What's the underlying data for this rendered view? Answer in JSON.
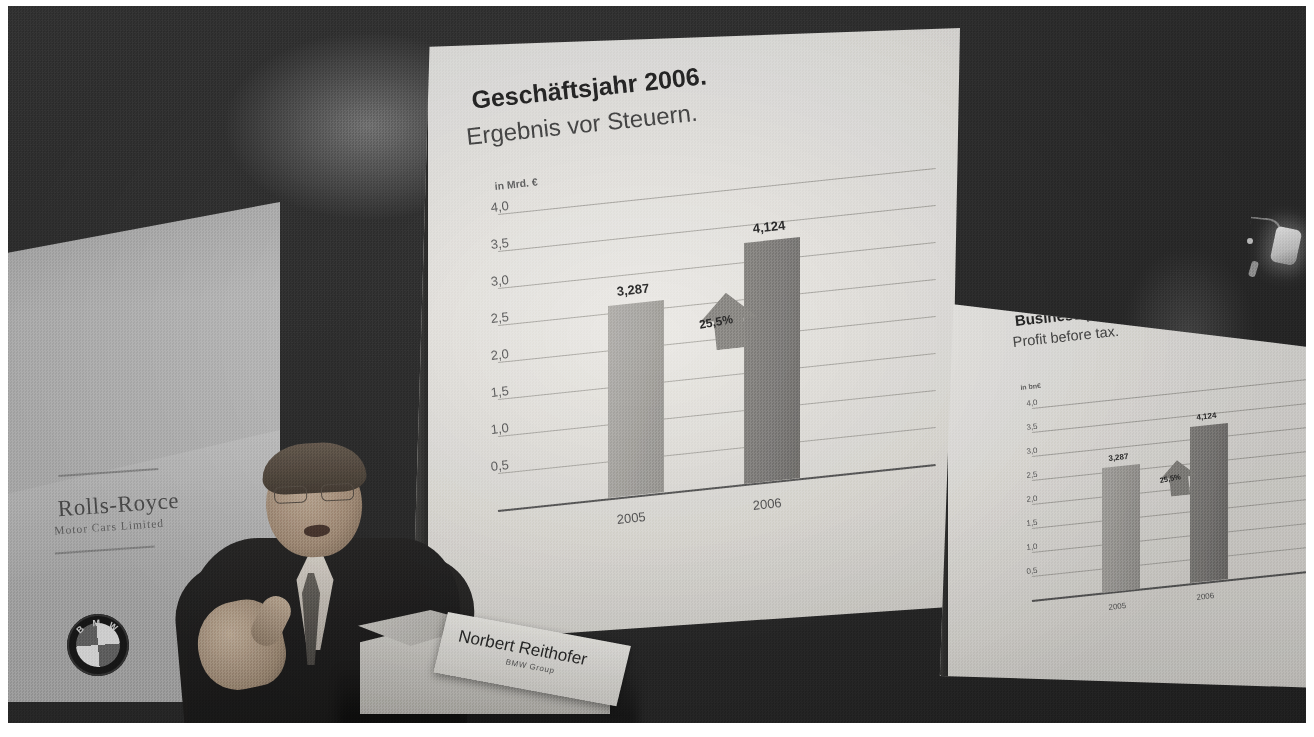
{
  "scene": {
    "title": "BMW Group Annual Press Conference",
    "speaker_name": "Norbert Reithofer",
    "speaker_org": "BMW Group"
  },
  "wall_panel": {
    "brand_name": "Rolls-Royce",
    "brand_sub": "Motor Cars Limited",
    "bmw_letters": [
      "B",
      "M",
      "W"
    ]
  },
  "lectern": {
    "name": "Norbert Reithofer",
    "org": "BMW Group"
  },
  "slide_de": {
    "title": "Geschäftsjahr 2006.",
    "subtitle": "Ergebnis vor Steuern.",
    "unit": "in Mrd. €",
    "ticks": [
      "4,0",
      "3,5",
      "3,0",
      "2,5",
      "2,0",
      "1,5",
      "1,0",
      "0,5"
    ],
    "bar_labels": [
      "3,287",
      "4,124"
    ],
    "categories": [
      "2005",
      "2006"
    ],
    "delta": "25,5%"
  },
  "slide_en": {
    "title": "Business year 2006.",
    "subtitle": "Profit before tax.",
    "unit": "in bn€",
    "ticks": [
      "4,0",
      "3,5",
      "3,0",
      "2,5",
      "2,0",
      "1,5",
      "1,0",
      "0,5"
    ],
    "bar_labels": [
      "3,287",
      "4,124"
    ],
    "categories": [
      "2005",
      "2006"
    ],
    "delta": "25,5%"
  },
  "chart_data": [
    {
      "type": "bar",
      "title": "Geschäftsjahr 2006.",
      "subtitle": "Ergebnis vor Steuern.",
      "categories": [
        "2005",
        "2006"
      ],
      "values": [
        3.287,
        4.124
      ],
      "data_labels": [
        "3,287",
        "4,124"
      ],
      "xlabel": "",
      "ylabel": "in Mrd. €",
      "ylim": [
        0,
        4.0
      ],
      "yticks": [
        0.5,
        1.0,
        1.5,
        2.0,
        2.5,
        3.0,
        3.5,
        4.0
      ],
      "ytick_labels": [
        "0,5",
        "1,0",
        "1,5",
        "2,0",
        "2,5",
        "3,0",
        "3,5",
        "4,0"
      ],
      "grid": true,
      "legend": "none",
      "annotations": [
        {
          "text": "25,5%",
          "kind": "up-arrow",
          "between": [
            "2005",
            "2006"
          ]
        }
      ],
      "series_colors": [
        "#a9a7a3",
        "#848280"
      ]
    },
    {
      "type": "bar",
      "title": "Business year 2006.",
      "subtitle": "Profit before tax.",
      "categories": [
        "2005",
        "2006"
      ],
      "values": [
        3.287,
        4.124
      ],
      "data_labels": [
        "3,287",
        "4,124"
      ],
      "xlabel": "",
      "ylabel": "in bn€",
      "ylim": [
        0,
        4.0
      ],
      "yticks": [
        0.5,
        1.0,
        1.5,
        2.0,
        2.5,
        3.0,
        3.5,
        4.0
      ],
      "ytick_labels": [
        "0,5",
        "1,0",
        "1,5",
        "2,0",
        "2,5",
        "3,0",
        "3,5",
        "4,0"
      ],
      "grid": true,
      "legend": "none",
      "annotations": [
        {
          "text": "25,5%",
          "kind": "up-arrow",
          "between": [
            "2005",
            "2006"
          ]
        }
      ],
      "series_colors": [
        "#a9a7a3",
        "#848280"
      ]
    }
  ],
  "colors": {
    "slide_bg": "#ecebe7",
    "bar_light": "#a9a7a3",
    "bar_dark": "#848280",
    "gridline": "#b2b0ab",
    "axis": "#5d5d5d",
    "backdrop": "#2e2e2e",
    "panel": "#c0c0c0"
  }
}
